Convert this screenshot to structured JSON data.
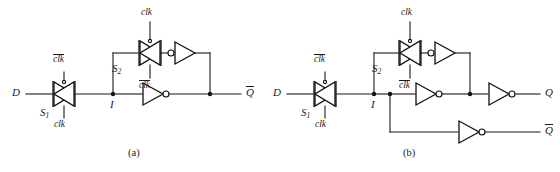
{
  "figure": {
    "background_color": "#ffffff",
    "ink_color": "#1a1a1a",
    "captions": {
      "a": "(a)",
      "b": "(b)"
    }
  },
  "diagram_a": {
    "caption": "(a)",
    "input_label": "D",
    "internal_node_label": "I",
    "output_label": "Q",
    "output_overbar": true,
    "gates": [
      {
        "name": "S1",
        "symbol": "transmission-gate",
        "base_label": "S",
        "subscript": "1",
        "top_control": "clk",
        "top_control_overbar": true,
        "bottom_control": "clk",
        "bottom_control_overbar": false
      },
      {
        "name": "S2",
        "symbol": "transmission-gate",
        "base_label": "S",
        "subscript": "2",
        "top_control": "clk",
        "top_control_overbar": false,
        "bottom_control": "clk",
        "bottom_control_overbar": true
      }
    ],
    "inverters": [
      {
        "name": "feedback-inverter",
        "direction": "left",
        "bubble_side": "left"
      },
      {
        "name": "output-inverter",
        "direction": "right",
        "bubble_side": "right"
      }
    ]
  },
  "diagram_b": {
    "caption": "(b)",
    "input_label": "D",
    "internal_node_label": "I",
    "outputs": [
      {
        "name": "q-output",
        "label": "Q",
        "overbar": false
      },
      {
        "name": "qbar-output",
        "label": "Q",
        "overbar": true
      }
    ],
    "gates": [
      {
        "name": "S1",
        "symbol": "transmission-gate",
        "base_label": "S",
        "subscript": "1",
        "top_control": "clk",
        "top_control_overbar": true,
        "bottom_control": "clk",
        "bottom_control_overbar": false
      },
      {
        "name": "S2",
        "symbol": "transmission-gate",
        "base_label": "S",
        "subscript": "2",
        "top_control": "clk",
        "top_control_overbar": false,
        "bottom_control": "clk",
        "bottom_control_overbar": true
      }
    ],
    "inverters": [
      {
        "name": "feedback-inverter",
        "direction": "left",
        "bubble_side": "left"
      },
      {
        "name": "middle-inverter",
        "direction": "right",
        "bubble_side": "right"
      },
      {
        "name": "q-output-inverter",
        "direction": "right",
        "bubble_side": "right"
      },
      {
        "name": "qbar-output-inverter",
        "direction": "right",
        "bubble_side": "right"
      }
    ]
  }
}
